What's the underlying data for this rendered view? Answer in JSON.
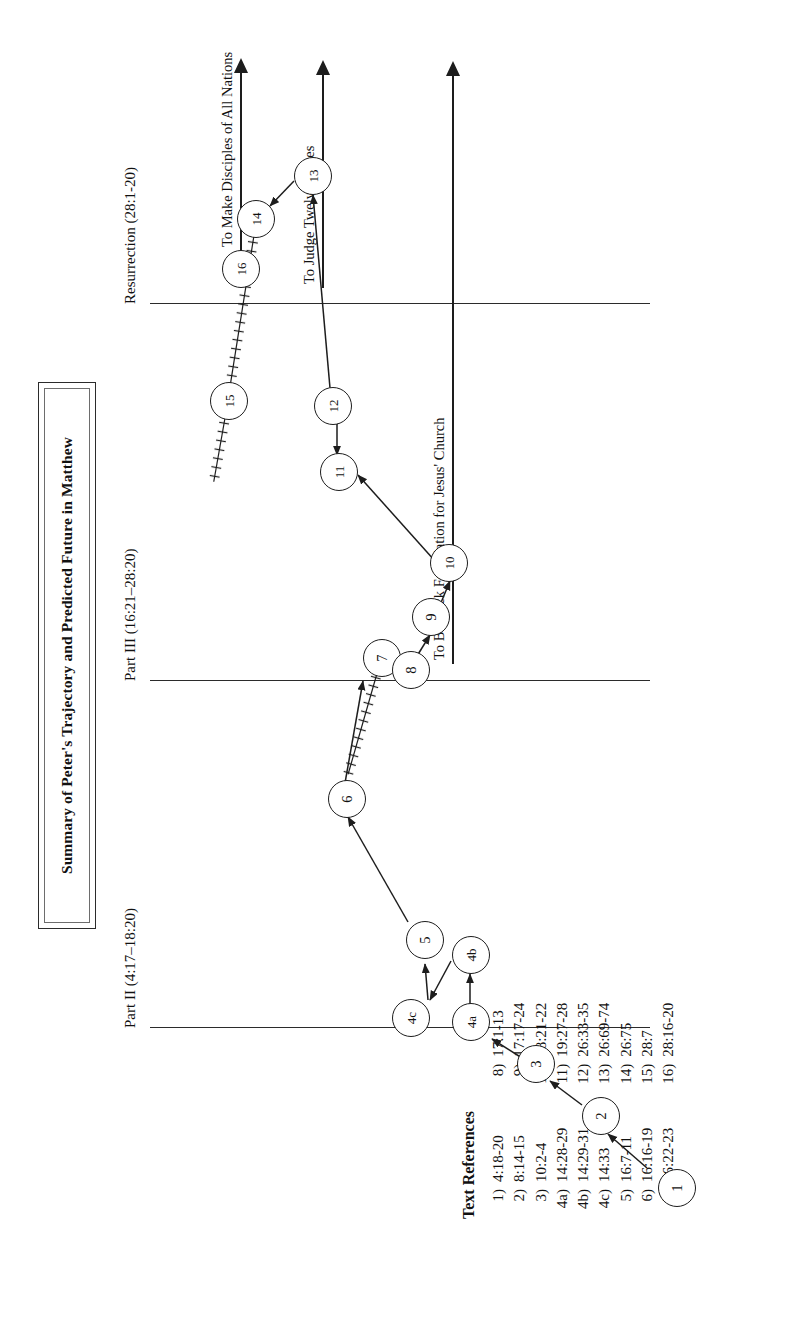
{
  "figure": {
    "title": "Summary of Peter's Trajectory and Predicted Future in Matthew",
    "sections": [
      {
        "id": "part2",
        "label": "Part II (4:17–18:20)"
      },
      {
        "id": "part3",
        "label": "Part III (16:21–28:20)"
      },
      {
        "id": "resurrection",
        "label": "Resurrection (28:1-20)"
      }
    ],
    "future_arrows": [
      {
        "id": "rock-foundation",
        "label": "To Be Rock Foundation for Jesus' Church",
        "from_node": "6"
      },
      {
        "id": "judge-twelve-tribes",
        "label": "To Judge Twelve Tribes",
        "from_node": "11"
      },
      {
        "id": "make-disciples",
        "label": "To Make Disciples of All Nations",
        "from_node": "16"
      }
    ],
    "nodes": [
      {
        "id": "1",
        "label": "1"
      },
      {
        "id": "2",
        "label": "2"
      },
      {
        "id": "3",
        "label": "3"
      },
      {
        "id": "4a",
        "label": "4a"
      },
      {
        "id": "4b",
        "label": "4b"
      },
      {
        "id": "4c",
        "label": "4c"
      },
      {
        "id": "5",
        "label": "5"
      },
      {
        "id": "6",
        "label": "6"
      },
      {
        "id": "7",
        "label": "7"
      },
      {
        "id": "8",
        "label": "8"
      },
      {
        "id": "9",
        "label": "9"
      },
      {
        "id": "10",
        "label": "10"
      },
      {
        "id": "11",
        "label": "11"
      },
      {
        "id": "12",
        "label": "12"
      },
      {
        "id": "13",
        "label": "13"
      },
      {
        "id": "14",
        "label": "14"
      },
      {
        "id": "15",
        "label": "15"
      },
      {
        "id": "16",
        "label": "16"
      }
    ],
    "edges": [
      {
        "from": "1",
        "to": "2",
        "style": "solid"
      },
      {
        "from": "2",
        "to": "3",
        "style": "solid"
      },
      {
        "from": "3",
        "to": "4a",
        "style": "solid"
      },
      {
        "from": "4a",
        "to": "4b",
        "style": "solid"
      },
      {
        "from": "4b",
        "to": "4c",
        "style": "solid"
      },
      {
        "from": "4c",
        "to": "5",
        "style": "solid"
      },
      {
        "from": "5",
        "to": "6",
        "style": "solid"
      },
      {
        "from": "6",
        "to": "7",
        "style": "solid"
      },
      {
        "from": "7",
        "to": "8",
        "style": "hatched"
      },
      {
        "from": "8",
        "to": "9",
        "style": "solid"
      },
      {
        "from": "9",
        "to": "10",
        "style": "solid"
      },
      {
        "from": "10",
        "to": "11",
        "style": "solid"
      },
      {
        "from": "12",
        "to": "11",
        "style": "solid"
      },
      {
        "from": "12",
        "to": "13",
        "style": "solid"
      },
      {
        "from": "13",
        "to": "14",
        "style": "solid"
      },
      {
        "from": "14",
        "to": "15",
        "style": "hatched"
      },
      {
        "from": "15",
        "to": "16",
        "style": "hatched"
      }
    ]
  },
  "references": {
    "heading": "Text References",
    "column_left": [
      {
        "num": "1)",
        "ref": "4:18-20"
      },
      {
        "num": "2)",
        "ref": "8:14-15"
      },
      {
        "num": "3)",
        "ref": "10:2-4"
      },
      {
        "num": "4a)",
        "ref": "14:28-29"
      },
      {
        "num": "4b)",
        "ref": "14:29-31"
      },
      {
        "num": "4c)",
        "ref": "14:33"
      },
      {
        "num": "5)",
        "ref": "16:7-11"
      },
      {
        "num": "6)",
        "ref": "16:16-19"
      },
      {
        "num": "7)",
        "ref": "16:22-23"
      }
    ],
    "column_right": [
      {
        "num": "8)",
        "ref": "17:1-13"
      },
      {
        "num": "9)",
        "ref": "17:17-24"
      },
      {
        "num": "10)",
        "ref": "18:21-22"
      },
      {
        "num": "11)",
        "ref": "19:27-28"
      },
      {
        "num": "12)",
        "ref": "26:33-35"
      },
      {
        "num": "13)",
        "ref": "26:69-74"
      },
      {
        "num": "14)",
        "ref": "26:75"
      },
      {
        "num": "15)",
        "ref": "28:7"
      },
      {
        "num": "16)",
        "ref": "28:16-20"
      }
    ]
  },
  "colors": {
    "ink": "#1d1d1d",
    "paper": "#ffffff"
  }
}
